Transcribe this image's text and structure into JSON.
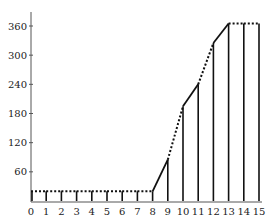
{
  "chart_data": {
    "type": "line",
    "title": "",
    "xlabel": "",
    "ylabel": "",
    "x": [
      0,
      1,
      2,
      3,
      4,
      5,
      6,
      7,
      8,
      9,
      10,
      11,
      12,
      13,
      14,
      15
    ],
    "series": [
      {
        "name": "cumulative",
        "values": [
          20,
          20,
          20,
          20,
          20,
          20,
          20,
          20,
          20,
          85,
          195,
          240,
          325,
          365,
          365,
          365
        ]
      }
    ],
    "segment_styles": [
      "dotted",
      "dotted",
      "dotted",
      "dotted",
      "dotted",
      "dotted",
      "dotted",
      "dotted",
      "solid",
      "dotted",
      "solid",
      "dotted",
      "solid",
      "dotted",
      "dotted"
    ],
    "xlim": [
      0,
      15
    ],
    "ylim": [
      0,
      380
    ],
    "xticks": [
      "0",
      "1",
      "2",
      "3",
      "4",
      "5",
      "6",
      "7",
      "8",
      "9",
      "10",
      "11",
      "12",
      "13",
      "14",
      "15"
    ],
    "yticks": [
      "60",
      "120",
      "180",
      "240",
      "300",
      "360"
    ],
    "ytick_values": [
      60,
      120,
      180,
      240,
      300,
      360
    ],
    "grid": false,
    "legend": "none",
    "drop_lines": true
  },
  "colors": {
    "line": "#111111",
    "axis": "#555555",
    "text": "#222222"
  }
}
